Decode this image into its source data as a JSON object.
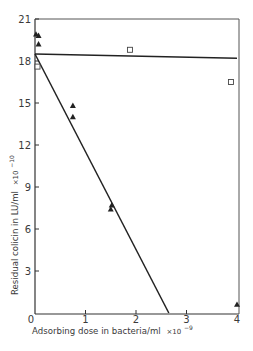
{
  "chart_data": {
    "type": "scatter",
    "title": "",
    "xlabel": "Adsorbing dose in bacteria/ml × 10⁻⁹",
    "ylabel": "Residual colicin in LU/ml × 10⁻¹⁰",
    "xlim": [
      0,
      4
    ],
    "ylim": [
      0,
      21
    ],
    "xticks": [
      0,
      1,
      2,
      3,
      4
    ],
    "yticks": [
      0,
      3,
      6,
      9,
      12,
      15,
      18,
      21
    ],
    "grid": false,
    "legend": null,
    "series": [
      {
        "name": "triangles",
        "marker": "filled-triangle",
        "points": [
          {
            "x": 0.02,
            "y": 19.9
          },
          {
            "x": 0.07,
            "y": 19.8
          },
          {
            "x": 0.07,
            "y": 19.2
          },
          {
            "x": 0.75,
            "y": 14.8
          },
          {
            "x": 0.75,
            "y": 14.0
          },
          {
            "x": 1.52,
            "y": 7.7
          },
          {
            "x": 1.5,
            "y": 7.4
          },
          {
            "x": 4.0,
            "y": 0.6
          }
        ],
        "fit_line": {
          "x1": 0.0,
          "y1": 18.5,
          "x2": 2.65,
          "y2": 0.0
        }
      },
      {
        "name": "squares",
        "marker": "open-square",
        "points": [
          {
            "x": 0.05,
            "y": 17.6
          },
          {
            "x": 1.88,
            "y": 18.8
          },
          {
            "x": 3.88,
            "y": 16.5
          }
        ],
        "fit_line": {
          "x1": 0.0,
          "y1": 18.5,
          "x2": 4.0,
          "y2": 18.2
        }
      }
    ]
  },
  "axes": {
    "x_tick_labels": [
      "0",
      "1",
      "2",
      "3",
      "4"
    ],
    "y_tick_labels": [
      "21",
      "18",
      "15",
      "12",
      "9",
      "6",
      "3"
    ],
    "xlabel_text": "Adsorbing dose in bacteria/ml",
    "xlabel_exp_text": "×10",
    "xlabel_exp_power": "−9",
    "ylabel_text": "Residual colicin in LU/ml",
    "ylabel_exp_text": "×10",
    "ylabel_exp_power": "−10"
  },
  "colors": {
    "ink": "#2a2a2a",
    "background": "#ffffff"
  }
}
